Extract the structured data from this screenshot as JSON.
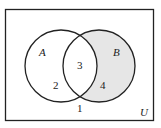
{
  "diagram": {
    "type": "venn",
    "universe_label": "U",
    "sets": [
      {
        "name": "A",
        "label": "A"
      },
      {
        "name": "B",
        "label": "B"
      }
    ],
    "regions": [
      {
        "id": "only-A",
        "label": "2"
      },
      {
        "id": "A-and-B",
        "label": "3"
      },
      {
        "id": "only-B",
        "label": "4",
        "shaded": true
      },
      {
        "id": "outside",
        "label": "1"
      }
    ],
    "colors": {
      "shade": "#e6e6e6",
      "stroke": "#222222",
      "background": "#ffffff"
    }
  }
}
